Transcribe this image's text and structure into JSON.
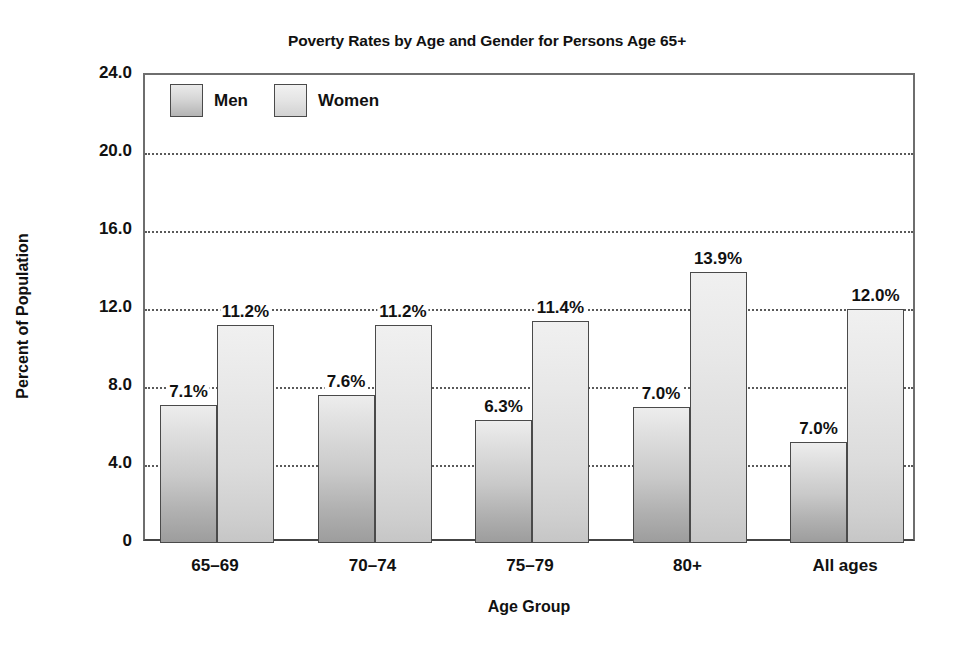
{
  "chart_data": {
    "type": "bar",
    "title": "Poverty Rates by Age and Gender for Persons Age 65+",
    "xlabel": "Age Group",
    "ylabel": "Percent of Population",
    "categories": [
      "65–69",
      "70–74",
      "75–79",
      "80+",
      "All ages"
    ],
    "series": [
      {
        "name": "Men",
        "values": [
          7.1,
          7.6,
          6.3,
          7.0,
          7.0
        ],
        "labels": [
          "7.1%",
          "7.6%",
          "6.3%",
          "7.0%",
          "7.0%"
        ],
        "drawn_heights": [
          7.1,
          7.6,
          6.3,
          7.0,
          5.2
        ]
      },
      {
        "name": "Women",
        "values": [
          11.2,
          11.2,
          11.4,
          13.9,
          12.0
        ],
        "labels": [
          "11.2%",
          "11.2%",
          "11.4%",
          "13.9%",
          "12.0%"
        ],
        "drawn_heights": [
          11.2,
          11.2,
          11.4,
          13.9,
          12.0
        ]
      }
    ],
    "ylim": [
      0,
      24
    ],
    "yticks": [
      24,
      20,
      16,
      12,
      8,
      4,
      0
    ],
    "ytick_labels": [
      "24.0",
      "20.0",
      "16.0",
      "12.0",
      "8.0",
      "4.0",
      "0"
    ],
    "grid": "horizontal-dotted",
    "legend_position": "top-left-inside",
    "colors": {
      "men_bar": "#c9c9c9",
      "women_bar": "#dcdcdc",
      "bar_outline": "#4a4a4a",
      "gridline": "#5a5a5a",
      "text": "#111111",
      "background": "#ffffff"
    }
  },
  "legend": {
    "entries": [
      {
        "label": "Men",
        "swatch": "men-swatch"
      },
      {
        "label": "Women",
        "swatch": "women-swatch"
      }
    ]
  }
}
